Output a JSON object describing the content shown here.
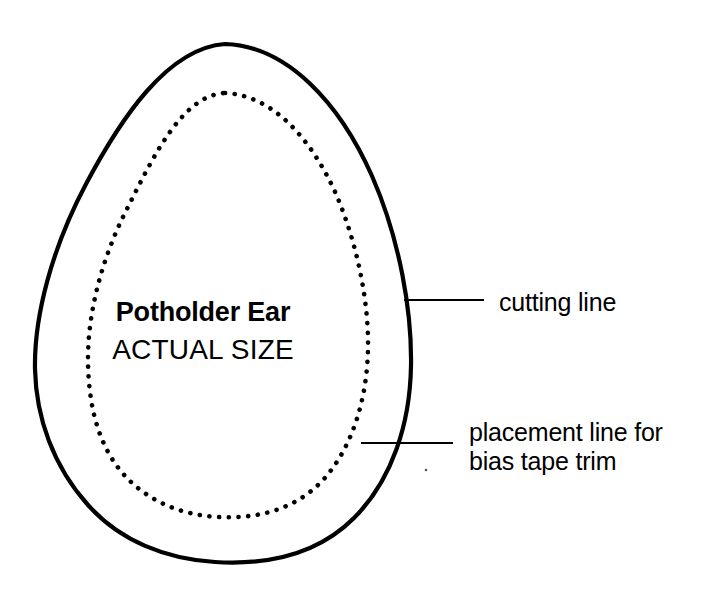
{
  "page": {
    "background_color": "#ffffff",
    "ink_color": "#000000",
    "width": 713,
    "height": 597
  },
  "diagram": {
    "title": "Potholder Ear",
    "size_note": "ACTUAL SIZE",
    "caption_title": "Potholder Ear",
    "caption_subtitle": "ACTUAL SIZE"
  },
  "annotations": [
    {
      "id": "cutting-line",
      "label": "cutting line",
      "line_style": "solid",
      "leader": {
        "x1": 404,
        "y1": 300,
        "x2": 484,
        "y2": 300
      }
    },
    {
      "id": "placement-line",
      "label_line_1": "placement line for",
      "label_line_2": "bias tape trim",
      "line_style": "dotted",
      "leader": {
        "x1": 361,
        "y1": 443,
        "x2": 453,
        "y2": 443
      }
    }
  ],
  "shapes": {
    "cutting_outline": {
      "name": "cutting-line-outline",
      "style": "solid",
      "stroke_width": 4,
      "color": "#000000",
      "bounds": {
        "top": 44,
        "bottom": 562,
        "left": 35,
        "right": 412
      }
    },
    "placement_outline": {
      "name": "placement-line-outline",
      "style": "dotted",
      "dot_radius": 2.4,
      "color": "#000000",
      "bounds": {
        "top": 93,
        "bottom": 518,
        "left": 88,
        "right": 369
      }
    }
  },
  "artifacts": {
    "speck": {
      "x": 426,
      "y": 470,
      "radius": 1.2
    }
  }
}
